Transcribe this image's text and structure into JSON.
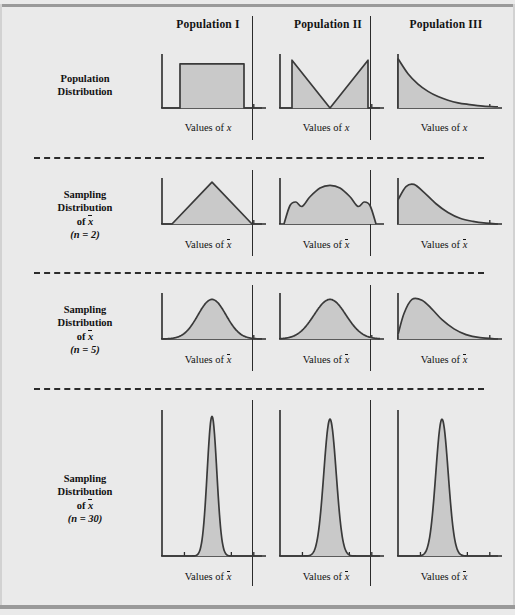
{
  "figure": {
    "background_color": "#eaeaea",
    "curve_color": "#3a3a3a",
    "fill_color": "#c9c9c9",
    "rule_color": "#9a9a9a"
  },
  "columns": [
    {
      "label": "Population I"
    },
    {
      "label": "Population II"
    },
    {
      "label": "Population III"
    }
  ],
  "rows": [
    {
      "label_lines": [
        "Population",
        "Distribution"
      ],
      "sample_size": null,
      "axis_caption_prefix": "Values of ",
      "axis_caption_var": "x"
    },
    {
      "label_lines": [
        "Sampling",
        "Distribution",
        "of",
        "(n = 2)"
      ],
      "sample_size": "(n = 2)",
      "axis_caption_prefix": "Values of ",
      "axis_caption_var": "x̄"
    },
    {
      "label_lines": [
        "Sampling",
        "Distribution",
        "of",
        "(n = 5)"
      ],
      "sample_size": "(n = 5)",
      "axis_caption_prefix": "Values of ",
      "axis_caption_var": "x̄"
    },
    {
      "label_lines": [
        "Sampling",
        "Distribution",
        "of",
        "(n = 30)"
      ],
      "sample_size": "(n = 30)",
      "axis_caption_prefix": "Values of ",
      "axis_caption_var": "x̄"
    }
  ],
  "labels": {
    "population_distribution_l1": "Population",
    "population_distribution_l2": "Distribution",
    "sampling": "Sampling",
    "distribution": "Distribution",
    "of": "of",
    "n2": "(n = 2)",
    "n5": "(n = 5)",
    "n30": "(n = 30)",
    "values_of": "Values of ",
    "var_x": "x",
    "var_xbar": "x"
  },
  "chart_data": {
    "type": "area",
    "xlabel_population": "Values of x",
    "xlabel_sampling": "Values of x̄",
    "ylabel": "",
    "grid": false,
    "legend": "none",
    "columns": [
      "Population I",
      "Population II",
      "Population III"
    ],
    "rows": [
      "Population Distribution",
      "Sampling Distribution of x-bar (n = 2)",
      "Sampling Distribution of x-bar (n = 5)",
      "Sampling Distribution of x-bar (n = 30)"
    ],
    "panels": [
      {
        "row": "Population Distribution",
        "column": "Population I",
        "shape": "uniform",
        "description": "Flat rectangular uniform density spanning the middle of the axis",
        "x": [
          0.0,
          0.18,
          0.18,
          0.82,
          0.82,
          1.0
        ],
        "y": [
          0.0,
          0.0,
          0.85,
          0.85,
          0.0,
          0.0
        ]
      },
      {
        "row": "Population Distribution",
        "column": "Population II",
        "shape": "u-shaped",
        "description": "V / U-shaped bimodal density, high at both ends, zero at center",
        "x": [
          0.0,
          0.12,
          0.12,
          0.5,
          0.88,
          0.88,
          1.0
        ],
        "y": [
          0.0,
          0.0,
          0.92,
          0.0,
          0.92,
          0.0,
          0.0
        ]
      },
      {
        "row": "Population Distribution",
        "column": "Population III",
        "shape": "exponential",
        "description": "Exponential decay, maximum at left edge decaying to zero",
        "x": [
          0.0,
          0.1,
          0.2,
          0.3,
          0.4,
          0.5,
          0.6,
          0.7,
          0.85,
          1.0
        ],
        "y": [
          0.95,
          0.66,
          0.46,
          0.32,
          0.22,
          0.15,
          0.1,
          0.07,
          0.035,
          0.02
        ]
      },
      {
        "row": "Sampling Distribution of x-bar (n = 2)",
        "column": "Population I",
        "shape": "triangular",
        "description": "Symmetric triangular density peaking at center",
        "x": [
          0.0,
          0.1,
          0.5,
          0.9,
          1.0
        ],
        "y": [
          0.0,
          0.0,
          0.95,
          0.0,
          0.0
        ]
      },
      {
        "row": "Sampling Distribution of x-bar (n = 2)",
        "column": "Population II",
        "shape": "trimodal-dome",
        "description": "Broad dome with two small side bumps near the edges",
        "x": [
          0.04,
          0.1,
          0.16,
          0.22,
          0.3,
          0.4,
          0.5,
          0.6,
          0.7,
          0.78,
          0.84,
          0.9,
          0.96
        ],
        "y": [
          0.0,
          0.42,
          0.5,
          0.4,
          0.62,
          0.82,
          0.88,
          0.82,
          0.62,
          0.4,
          0.5,
          0.42,
          0.0
        ]
      },
      {
        "row": "Sampling Distribution of x-bar (n = 2)",
        "column": "Population III",
        "shape": "right-skewed",
        "description": "Strongly right-skewed hump with mode near left, long right tail",
        "x": [
          0.0,
          0.08,
          0.16,
          0.26,
          0.38,
          0.5,
          0.62,
          0.75,
          0.88,
          1.0
        ],
        "y": [
          0.55,
          0.85,
          0.9,
          0.72,
          0.46,
          0.26,
          0.13,
          0.06,
          0.02,
          0.0
        ]
      },
      {
        "row": "Sampling Distribution of x-bar (n = 5)",
        "column": "Population I",
        "shape": "normal",
        "description": "Symmetric bell curve centered on the axis",
        "mean": 0.5,
        "sd": 0.14,
        "peak": 0.9
      },
      {
        "row": "Sampling Distribution of x-bar (n = 5)",
        "column": "Population II",
        "shape": "normal",
        "description": "Symmetric bell curve, slightly wider",
        "mean": 0.5,
        "sd": 0.16,
        "peak": 0.9
      },
      {
        "row": "Sampling Distribution of x-bar (n = 5)",
        "column": "Population III",
        "shape": "mildly-right-skewed",
        "description": "Nearly bell shaped with slight right skew, mode left of center",
        "x": [
          0.0,
          0.06,
          0.14,
          0.24,
          0.34,
          0.44,
          0.56,
          0.68,
          0.82,
          1.0
        ],
        "y": [
          0.1,
          0.58,
          0.9,
          0.88,
          0.68,
          0.44,
          0.23,
          0.1,
          0.03,
          0.0
        ]
      },
      {
        "row": "Sampling Distribution of x-bar (n = 30)",
        "column": "Population I",
        "shape": "normal-narrow",
        "description": "Very tall narrow bell curve centered on the axis",
        "mean": 0.5,
        "sd": 0.048,
        "peak": 0.97
      },
      {
        "row": "Sampling Distribution of x-bar (n = 30)",
        "column": "Population II",
        "shape": "normal-narrow",
        "description": "Tall narrow bell curve centered on the axis",
        "mean": 0.5,
        "sd": 0.062,
        "peak": 0.95
      },
      {
        "row": "Sampling Distribution of x-bar (n = 30)",
        "column": "Population III",
        "shape": "normal-narrow",
        "description": "Tall narrow bell curve slightly left of center",
        "mean": 0.44,
        "sd": 0.062,
        "peak": 0.95
      }
    ]
  }
}
